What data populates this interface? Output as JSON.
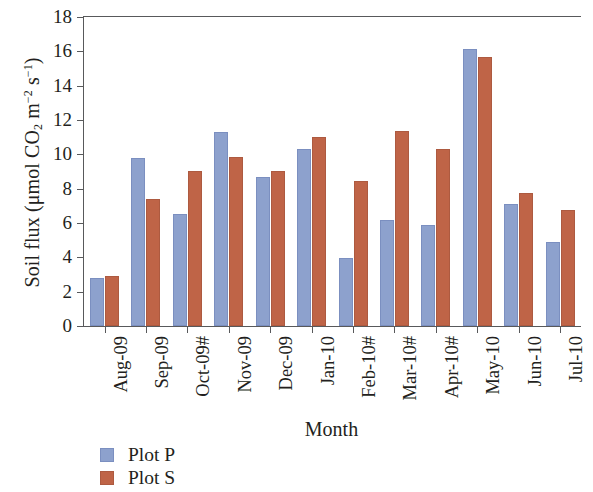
{
  "chart_data": {
    "type": "bar",
    "title": "",
    "xlabel": "Month",
    "ylabel": "Soil flux (μmol CO2 m-2 s-1)",
    "ylabel_parts": {
      "pre": "Soil flux (",
      "mu": "μmol CO",
      "sub1": "2",
      "mid": " m",
      "sup1": "−2",
      "mid2": " s",
      "sup2": "−1",
      "post": ")"
    },
    "categories": [
      "Aug-09",
      "Sep-09",
      "Oct-09#",
      "Nov-09",
      "Dec-09",
      "Jan-10",
      "Feb-10#",
      "Mar-10#",
      "Apr-10#",
      "May-10",
      "Jun-10",
      "Jul-10"
    ],
    "series": [
      {
        "name": "Plot P",
        "color": "#8da1cd",
        "values": [
          2.8,
          9.8,
          6.5,
          11.3,
          8.7,
          10.3,
          3.95,
          6.15,
          5.9,
          16.15,
          7.1,
          4.9
        ]
      },
      {
        "name": "Plot S",
        "color": "#bf6447",
        "values": [
          2.9,
          7.4,
          9.05,
          9.85,
          9.05,
          11.0,
          8.45,
          11.35,
          10.3,
          15.65,
          7.75,
          6.75
        ]
      }
    ],
    "ylim": [
      0,
      18
    ],
    "ytick_labels": [
      "0",
      "2",
      "4",
      "6",
      "8",
      "10",
      "12",
      "14",
      "16",
      "18"
    ],
    "ytick_values": [
      0,
      2,
      4,
      6,
      8,
      10,
      12,
      14,
      16,
      18
    ],
    "grid": false,
    "legend_position": "bottom-left",
    "legend": [
      {
        "label": "Plot P",
        "color": "#8da1cd"
      },
      {
        "label": "Plot S",
        "color": "#bf6447"
      }
    ]
  }
}
